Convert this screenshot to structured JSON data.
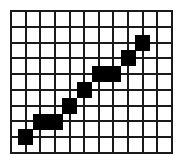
{
  "diagram": {
    "type": "raster-line-on-grid",
    "grid": {
      "columns": 11,
      "rows": 9,
      "line_color": "#1a1a1a",
      "background": "#ffffff"
    },
    "pixel_color": "#000000",
    "pixels": [
      {
        "x": 1,
        "y": 8
      },
      {
        "x": 2,
        "y": 7
      },
      {
        "x": 3,
        "y": 7
      },
      {
        "x": 4,
        "y": 6
      },
      {
        "x": 5,
        "y": 5
      },
      {
        "x": 6,
        "y": 4
      },
      {
        "x": 7,
        "y": 4
      },
      {
        "x": 8,
        "y": 3
      },
      {
        "x": 9,
        "y": 2
      }
    ]
  }
}
